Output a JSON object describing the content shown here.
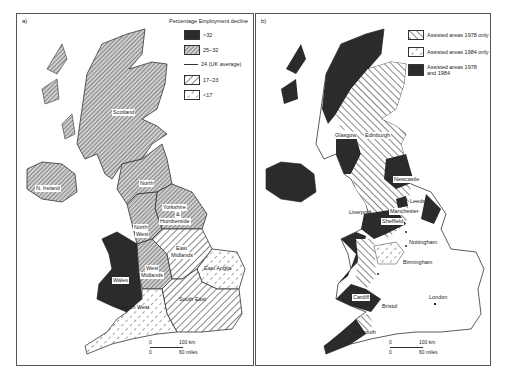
{
  "map_a": {
    "panel_label": "a)",
    "legend": {
      "title": "Percentage Employment decline",
      "items": [
        {
          "label": ">32",
          "pattern": "solid-dark"
        },
        {
          "label": "25–32",
          "pattern": "fine-hatch"
        },
        {
          "label": "24 (UK average)",
          "pattern": "line"
        },
        {
          "label": "17–23",
          "pattern": "wide-hatch"
        },
        {
          "label": "<17",
          "pattern": "dashed-hatch"
        }
      ]
    },
    "regions": [
      {
        "name": "Scotland",
        "class": "25–32"
      },
      {
        "name": "N. Ireland",
        "class": "25–32"
      },
      {
        "name": "North",
        "class": "25–32"
      },
      {
        "name": "Yorkshire & Humberside",
        "class": "25–32"
      },
      {
        "name": "North West",
        "class": "25–32"
      },
      {
        "name": "West Midlands",
        "class": "25–32"
      },
      {
        "name": "Wales",
        "class": ">32"
      },
      {
        "name": "East Midlands",
        "class": "17–23"
      },
      {
        "name": "East Anglia",
        "class": "<17"
      },
      {
        "name": "South East",
        "class": "17–23"
      },
      {
        "name": "South West",
        "class": "<17"
      }
    ],
    "labels": {
      "scotland": "Scotland",
      "n_ireland": "N. Ireland",
      "north": "North",
      "yorks1": "Yorkshire",
      "yorks2": "&",
      "yorks3": "Humberside",
      "nw1": "North",
      "nw2": "West",
      "em1": "East",
      "em2": "Midlands",
      "wm1": "West",
      "wm2": "Midlands",
      "wales": "Wales",
      "east_anglia": "East Anglia",
      "south_east": "South East",
      "south_west": "South West"
    },
    "scale": {
      "zero_top": "0",
      "km": "100 km",
      "zero_bottom": "0",
      "miles": "60 miles"
    }
  },
  "map_b": {
    "panel_label": "b)",
    "legend": {
      "items": [
        {
          "label": "Assisted areas 1978 only",
          "pattern": "wide-hatch"
        },
        {
          "label": "Assisted areas 1984 only",
          "pattern": "dashed-hatch"
        },
        {
          "label": "Assisted areas 1978 and 1984",
          "pattern": "solid-dark"
        }
      ]
    },
    "cities": {
      "glasgow": "Glasgow",
      "edinburgh": "Edinburgh",
      "newcastle": "Newcastle",
      "leeds": "Leeds",
      "liverpool": "Liverpool",
      "manchester": "Manchester",
      "sheffield": "Sheffield",
      "nottingham": "Nottingham",
      "birmingham": "Birmingham",
      "cardiff": "Cardiff",
      "bristol": "Bristol",
      "london": "London",
      "plymouth": "Plymouth"
    },
    "scale": {
      "zero_top": "0",
      "km": "100 km",
      "zero_bottom": "0",
      "miles": "60 miles"
    }
  },
  "colors": {
    "dark": "#2b2b2b",
    "hatch": "#444444",
    "border": "#555555"
  }
}
